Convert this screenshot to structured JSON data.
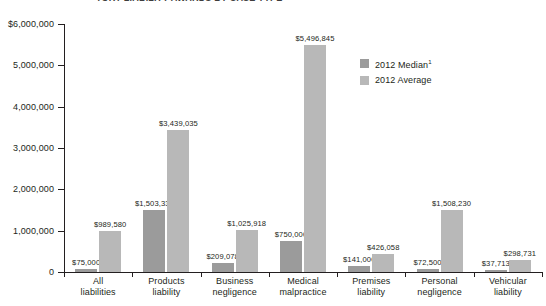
{
  "title": {
    "text": "TORT LIABILITY AWARDS BY CASE TYPE"
  },
  "chart_data": {
    "type": "bar",
    "title": "",
    "xlabel": "",
    "ylabel": "",
    "ylim": [
      0,
      6000000
    ],
    "grid": false,
    "legend_position": "inside-top-right",
    "categories": [
      "All liabilities",
      "Products liability",
      "Business negligence",
      "Medical malpractice",
      "Premises liability",
      "Personal negligence",
      "Vehicular liability"
    ],
    "category_lines": [
      [
        "All",
        "liabilities"
      ],
      [
        "Products",
        "liability"
      ],
      [
        "Business",
        "negligence"
      ],
      [
        "Medical",
        "malpractice"
      ],
      [
        "Premises",
        "liability"
      ],
      [
        "Personal",
        "negligence"
      ],
      [
        "Vehicular",
        "liability"
      ]
    ],
    "series": [
      {
        "name": "2012 Median",
        "color": "#9b9b9b",
        "values": [
          75000,
          1503339,
          209078,
          750000,
          141000,
          72500,
          37713
        ],
        "labels": [
          "$75,000",
          "$1,503,339",
          "$209,078",
          "$750,000",
          "$141,000",
          "$72,500",
          "$37,713"
        ]
      },
      {
        "name": "2012 Average",
        "color": "#b8b8b8",
        "values": [
          989580,
          3439035,
          1025918,
          5496845,
          426058,
          1508230,
          298731
        ],
        "labels": [
          "$989,580",
          "$3,439,035",
          "$1,025,918",
          "$5,496,845",
          "$426,058",
          "$1,508,230",
          "$298,731"
        ]
      }
    ],
    "yticks": [
      0,
      1000000,
      2000000,
      3000000,
      4000000,
      5000000,
      6000000
    ],
    "ytick_labels": [
      "0",
      "1,000,000",
      "2,000,000",
      "3,000,000",
      "4,000,000",
      "5,000,000",
      "$6,000,000"
    ]
  },
  "legend": {
    "items": [
      {
        "label": "2012 Median",
        "footnote": "1",
        "color": "#9b9b9b"
      },
      {
        "label": "2012 Average",
        "footnote": "",
        "color": "#b8b8b8"
      }
    ]
  }
}
